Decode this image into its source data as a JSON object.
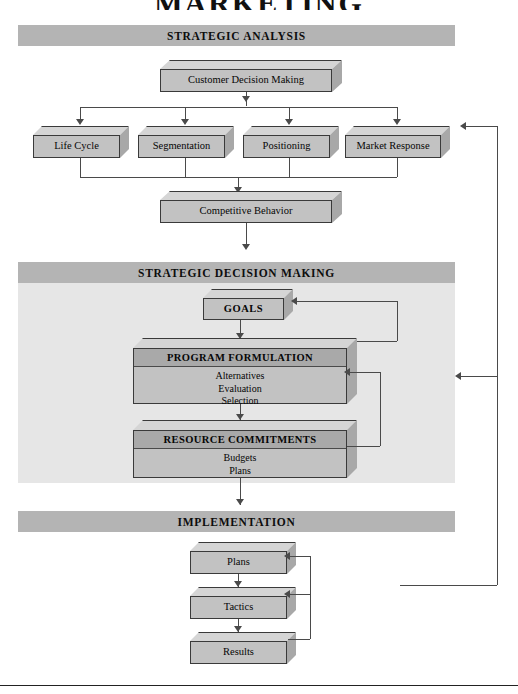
{
  "title": "MARKETING",
  "sections": {
    "strategic_analysis": {
      "banner": "STRATEGIC ANALYSIS"
    },
    "strategic_decision_making": {
      "banner": "STRATEGIC DECISION MAKING"
    },
    "implementation": {
      "banner": "IMPLEMENTATION"
    }
  },
  "nodes": {
    "customer_decision_making": "Customer Decision Making",
    "life_cycle": "Life Cycle",
    "segmentation": "Segmentation",
    "positioning": "Positioning",
    "market_response": "Market Response",
    "competitive_behavior": "Competitive Behavior",
    "goals": "GOALS",
    "program_formulation": {
      "header": "PROGRAM FORMULATION",
      "items": [
        "Alternatives",
        "Evaluation",
        "Selection"
      ]
    },
    "resource_commitments": {
      "header": "RESOURCE COMMITMENTS",
      "items": [
        "Budgets",
        "Plans"
      ]
    },
    "plans": "Plans",
    "tactics": "Tactics",
    "results": "Results"
  },
  "colors": {
    "banner_gray": "#b4b4b4",
    "panel_gray": "#e6e6e6",
    "box_face": "#c2c2c2",
    "box_top": "#d5d5d5",
    "box_side": "#a8a8a8",
    "header_bar": "#a9a9a9",
    "line": "#4a4a4a",
    "text": "#060606"
  }
}
